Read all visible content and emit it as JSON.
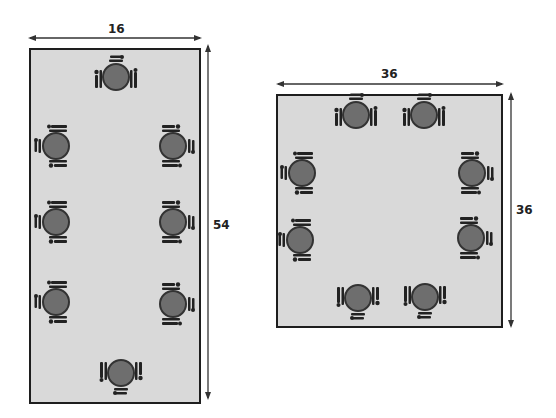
{
  "diagram": {
    "tables": [
      {
        "id": "rect-table",
        "shape": "rectangle",
        "width_label": "16",
        "height_label": "54",
        "seats": 8,
        "place_settings": [
          {
            "side": "top",
            "facing": "down"
          },
          {
            "side": "left",
            "facing": "right"
          },
          {
            "side": "right",
            "facing": "left"
          },
          {
            "side": "left",
            "facing": "right"
          },
          {
            "side": "right",
            "facing": "left"
          },
          {
            "side": "left",
            "facing": "right"
          },
          {
            "side": "right",
            "facing": "left"
          },
          {
            "side": "bottom",
            "facing": "up"
          }
        ]
      },
      {
        "id": "square-table",
        "shape": "square",
        "width_label": "36",
        "height_label": "36",
        "seats": 8,
        "place_settings": [
          {
            "side": "top",
            "facing": "down"
          },
          {
            "side": "top",
            "facing": "down"
          },
          {
            "side": "left",
            "facing": "right"
          },
          {
            "side": "right",
            "facing": "left"
          },
          {
            "side": "left",
            "facing": "right"
          },
          {
            "side": "right",
            "facing": "left"
          },
          {
            "side": "bottom",
            "facing": "up"
          },
          {
            "side": "bottom",
            "facing": "up"
          }
        ]
      }
    ],
    "colors": {
      "table_fill": "#d9d9d9",
      "border": "#1e1e1e",
      "plate": "#6e6e6e",
      "plate_rim": "#333333",
      "cutlery": "#222222"
    }
  }
}
